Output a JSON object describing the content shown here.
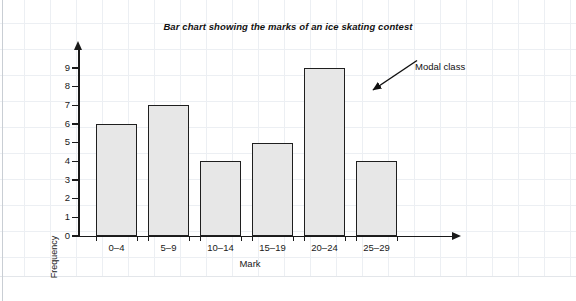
{
  "chart_data": {
    "type": "bar",
    "title": "Bar chart showing the marks of an ice skating contest",
    "xlabel": "Mark",
    "ylabel": "Frequency",
    "categories": [
      "0–4",
      "5–9",
      "10–14",
      "15–19",
      "20–24",
      "25–29"
    ],
    "values": [
      6,
      7,
      4,
      5,
      9,
      4
    ],
    "ylim": [
      0,
      9
    ],
    "ytick_labels": [
      "0",
      "1",
      "2",
      "3",
      "4",
      "5",
      "6",
      "7",
      "8",
      "9"
    ],
    "grid": false,
    "legend": "none",
    "annotations": [
      {
        "text": "Modal class",
        "points_to_category": "20–24",
        "points_to_value": 9
      }
    ],
    "bar_fill_color": "#e7e7e7",
    "bar_border_color": "#1f1f1f",
    "axis_color": "#1a1a1a"
  },
  "page": {
    "background_color": "#ffffff",
    "grid_line_color": "#eceff3"
  }
}
